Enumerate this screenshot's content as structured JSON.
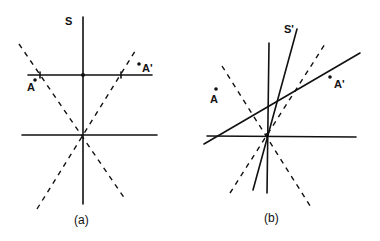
{
  "figure": {
    "panel_a": {
      "caption": "(a)",
      "axis_label": "S",
      "point_labels": {
        "a": "A",
        "a_prime": "A'"
      }
    },
    "panel_b": {
      "caption": "(b)",
      "axis_label": "S'",
      "point_labels": {
        "a": "A",
        "a_prime": "A'"
      }
    }
  },
  "colors": {
    "ink": "#111111",
    "background": "#ffffff"
  }
}
